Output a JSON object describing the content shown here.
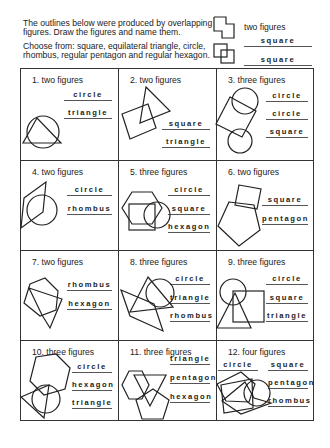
{
  "instructions": {
    "line1": "The outlines below were produced by overlapping",
    "line2": "figures.  Draw the figures and name them.",
    "line3": "Choose from: square, equilateral triangle, circle,",
    "line4": "rhombus, regular pentagon and regular hexagon."
  },
  "example": {
    "label": "two figures",
    "answers": [
      "square",
      "square"
    ]
  },
  "problems": [
    {
      "title": "1.  two figures",
      "answers": [
        "circle",
        "triangle"
      ]
    },
    {
      "title": "2.  two figures",
      "answers": [
        "square",
        "triangle"
      ]
    },
    {
      "title": "3.  three figures",
      "answers": [
        "circle",
        "circle",
        "square"
      ]
    },
    {
      "title": "4.  two figures",
      "answers": [
        "circle",
        "rhombus"
      ]
    },
    {
      "title": "5.  three figures",
      "answers": [
        "circle",
        "square",
        "hexagon"
      ]
    },
    {
      "title": "6.  two figures",
      "answers": [
        "square",
        "pentagon"
      ]
    },
    {
      "title": "7.  two figures",
      "answers": [
        "rhombus",
        "hexagon"
      ]
    },
    {
      "title": "8.  three figures",
      "answers": [
        "circle",
        "triangle",
        "rhombus"
      ]
    },
    {
      "title": "9.  three figures",
      "answers": [
        "circle",
        "square",
        "triangle"
      ]
    },
    {
      "title": "10.  three figures",
      "answers": [
        "circle",
        "hexagon",
        "triangle"
      ]
    },
    {
      "title": "11.  three figures",
      "answers": [
        "triangle",
        "pentagon",
        "hexagon"
      ]
    },
    {
      "title": "12.  four figures",
      "answers": [
        "circle",
        "square",
        "pentagon",
        "rhombus"
      ]
    }
  ]
}
